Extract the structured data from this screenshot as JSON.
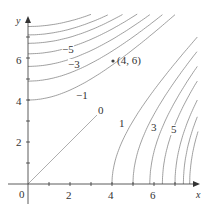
{
  "chart_data": {
    "type": "contour",
    "title": "",
    "xlabel": "x",
    "ylabel": "y",
    "xlim": [
      0,
      8
    ],
    "ylim": [
      0,
      8
    ],
    "x_ticks": [
      "2",
      "4",
      "6"
    ],
    "y_ticks": [
      "2",
      "4",
      "6"
    ],
    "origin_label": "0",
    "level_labels": [
      "-5",
      "-3",
      "-1",
      "0",
      "1",
      "3",
      "5"
    ],
    "levels": [
      -7,
      -6,
      -5,
      -4,
      -3,
      -2,
      -1,
      0,
      1,
      2,
      3,
      4,
      5,
      6,
      7
    ],
    "negative_level_y_intercepts": {
      "-1": 4.0,
      "-2": 4.9,
      "-3": 5.6,
      "-4": 6.2,
      "-5": 6.7,
      "-6": 7.1,
      "-7": 7.5
    },
    "positive_level_x_intercepts": {
      "1": 4.0,
      "2": 5.0,
      "3": 5.8,
      "4": 6.4,
      "5": 7.0,
      "6": 7.4,
      "7": 7.7
    },
    "zero_level": "line y = x",
    "annotations": [
      {
        "label": "(4, 6)",
        "x": 4,
        "y": 6
      }
    ]
  },
  "labels": {
    "x_axis": "x",
    "y_axis": "y",
    "origin": "0",
    "x2": "2",
    "x4": "4",
    "x6": "6",
    "y2": "2",
    "y4": "4",
    "y6": "6",
    "lm5": "−5",
    "lm3": "−3",
    "lm1": "−1",
    "l0": "0",
    "l1": "1",
    "l3": "3",
    "l5": "5",
    "point": "(4, 6)"
  }
}
